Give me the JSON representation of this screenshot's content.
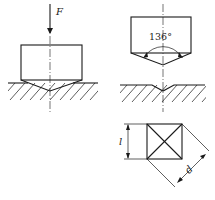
{
  "figure": {
    "labels": {
      "force": "F",
      "angle": "136°",
      "side": "l",
      "diagonal": "d"
    }
  }
}
